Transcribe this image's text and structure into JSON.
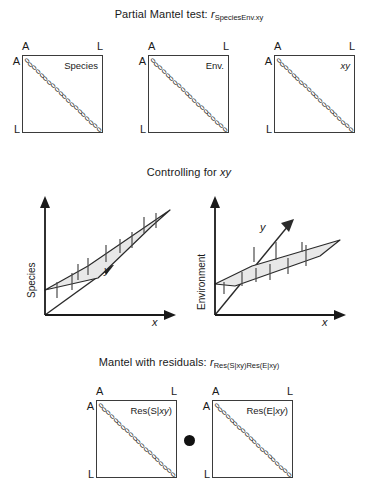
{
  "figure": {
    "background": "#ffffff",
    "line_color": "#3b3b3b",
    "plane_fill": "#e8e8e8",
    "dot_color": "#111111"
  },
  "sections": {
    "top": {
      "title_prefix": "Partial Mantel test: ",
      "title_r": "r",
      "title_subscript": "SpeciesEnv.xy",
      "matrices": [
        {
          "label": "Species",
          "label_italic": false,
          "corner_top_left": "A",
          "corner_top_right": "L",
          "corner_left_top": "A",
          "corner_left_bottom": "L",
          "diagonal_value": "0",
          "diagonal_count": 20
        },
        {
          "label": "Env.",
          "label_italic": false,
          "corner_top_left": "A",
          "corner_top_right": "L",
          "corner_left_top": "A",
          "corner_left_bottom": "L",
          "diagonal_value": "0",
          "diagonal_count": 20
        },
        {
          "label": "xy",
          "label_italic": true,
          "corner_top_left": "A",
          "corner_top_right": "L",
          "corner_left_top": "A",
          "corner_left_bottom": "L",
          "diagonal_value": "0",
          "diagonal_count": 20
        }
      ]
    },
    "middle": {
      "title_prefix": "Controlling for ",
      "title_italic": "xy",
      "plots": [
        {
          "y_axis_label": "Species",
          "x_axis_label": "x",
          "depth_axis_label": "y"
        },
        {
          "y_axis_label": "Environment",
          "x_axis_label": "x",
          "depth_axis_label": "y"
        }
      ]
    },
    "bottom": {
      "title_prefix": "Mantel with residuals: ",
      "title_r": "r",
      "title_subscript": "Res(S|xy)Res(E|xy)",
      "operator": "dot-operator",
      "matrices": [
        {
          "label": "Res(S|xy)",
          "label_italic_part": "xy",
          "corner_top_left": "A",
          "corner_top_right": "L",
          "corner_left_top": "A",
          "corner_left_bottom": "L",
          "diagonal_value": "0",
          "diagonal_count": 20
        },
        {
          "label": "Res(E|xy)",
          "label_italic_part": "xy",
          "corner_top_left": "A",
          "corner_top_right": "L",
          "corner_left_top": "A",
          "corner_left_bottom": "L",
          "diagonal_value": "0",
          "diagonal_count": 20
        }
      ]
    }
  },
  "chart_data": {
    "type": "diagram",
    "matrices_top": [
      "Species",
      "Env.",
      "xy"
    ],
    "matrices_bottom": [
      "Res(S|xy)",
      "Res(E|xy)"
    ],
    "plots": [
      {
        "ylabel": "Species",
        "xlabel": "x",
        "zlabel": "y",
        "surface": "tilted plane rising left-to-right",
        "error_bars": 9
      },
      {
        "ylabel": "Environment",
        "xlabel": "x",
        "zlabel": "y",
        "surface": "shallow plane rising left-to-right",
        "error_bars": 9
      }
    ]
  }
}
